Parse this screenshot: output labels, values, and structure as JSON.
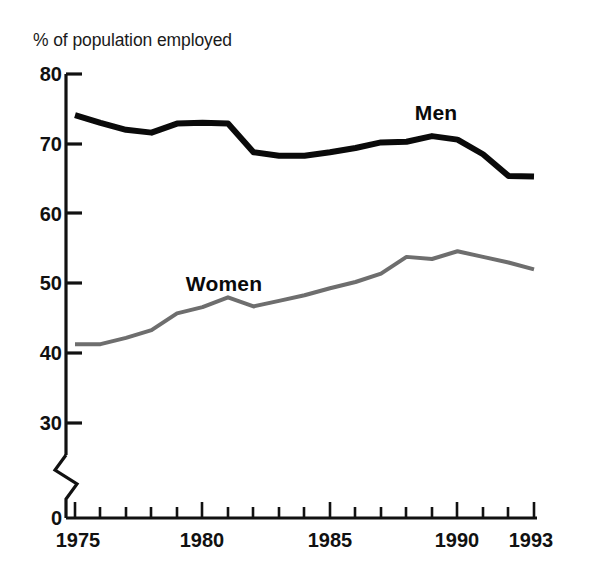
{
  "chart_data": {
    "type": "line",
    "title": "",
    "ylabel": "% of population employed",
    "xlabel": "",
    "ylim": [
      30,
      80
    ],
    "xlim": [
      1975,
      1993
    ],
    "grid": false,
    "legend_position": "inline-annotation",
    "axis_break": true,
    "axis_break_note": "y-axis broken between 0 and 30",
    "ytick_labels": [
      "80",
      "70",
      "60",
      "50",
      "40",
      "30",
      "0"
    ],
    "ytick_values": [
      80,
      70,
      60,
      50,
      40,
      30,
      0
    ],
    "xtick_labels": [
      "1975",
      "1980",
      "1985",
      "1990",
      "1993"
    ],
    "xtick_values": [
      1975,
      1980,
      1985,
      1990,
      1993
    ],
    "x": [
      1975,
      1976,
      1977,
      1978,
      1979,
      1980,
      1981,
      1982,
      1983,
      1984,
      1985,
      1986,
      1987,
      1988,
      1989,
      1990,
      1991,
      1992,
      1993
    ],
    "series": [
      {
        "name": "Men",
        "color": "#0a0a0a",
        "line_width": 6,
        "label_x": 1989,
        "label_y": 76.5,
        "values": [
          74.1,
          73.0,
          72.0,
          71.6,
          72.9,
          73.0,
          72.9,
          68.8,
          68.3,
          68.3,
          68.8,
          69.4,
          70.2,
          70.3,
          71.1,
          70.6,
          68.5,
          65.4,
          65.3
        ]
      },
      {
        "name": "Women",
        "color": "#6e6e6e",
        "line_width": 4,
        "label_x": 1979.8,
        "label_y": 51.5,
        "values": [
          41.3,
          41.3,
          42.2,
          43.3,
          45.7,
          46.6,
          48.0,
          46.7,
          47.5,
          48.3,
          49.3,
          50.2,
          51.4,
          53.8,
          53.5,
          54.6,
          53.8,
          53.0,
          52.0
        ]
      }
    ]
  }
}
